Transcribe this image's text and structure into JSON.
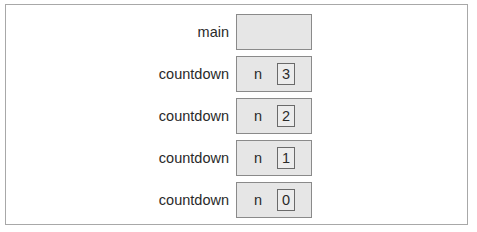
{
  "diagram": {
    "frames": [
      {
        "name": "main",
        "variables": []
      },
      {
        "name": "countdown",
        "variables": [
          {
            "name": "n",
            "value": "3"
          }
        ]
      },
      {
        "name": "countdown",
        "variables": [
          {
            "name": "n",
            "value": "2"
          }
        ]
      },
      {
        "name": "countdown",
        "variables": [
          {
            "name": "n",
            "value": "1"
          }
        ]
      },
      {
        "name": "countdown",
        "variables": [
          {
            "name": "n",
            "value": "0"
          }
        ]
      }
    ]
  }
}
